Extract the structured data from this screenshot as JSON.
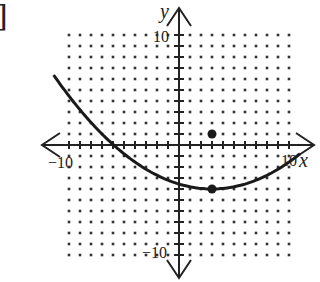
{
  "header": {
    "bracket": "]"
  },
  "chart_data": {
    "type": "line",
    "title": "",
    "xlabel": "x",
    "ylabel": "y",
    "xlim": [
      -10,
      10
    ],
    "ylim": [
      -10,
      10
    ],
    "grid": "dotted",
    "tick_labels": {
      "x_min": "−10",
      "x_max": "10",
      "y_min": "−10",
      "y_max": "10"
    },
    "series": [
      {
        "name": "parabola",
        "equation": "y = (x - 3)^2 / 20 - 4",
        "vertex": [
          3,
          -4
        ],
        "x_range": [
          -11.4,
          11
        ]
      }
    ],
    "points": [
      {
        "label": "vertex",
        "x": 3,
        "y": -4
      },
      {
        "label": "point",
        "x": 3,
        "y": 1
      }
    ]
  },
  "axes": {
    "x_label": "x",
    "y_label": "y",
    "x_min": "−10",
    "x_max": "10",
    "y_min": "−10",
    "y_max": "10"
  },
  "style": {
    "ink": "#222222",
    "dot": "#333333"
  }
}
